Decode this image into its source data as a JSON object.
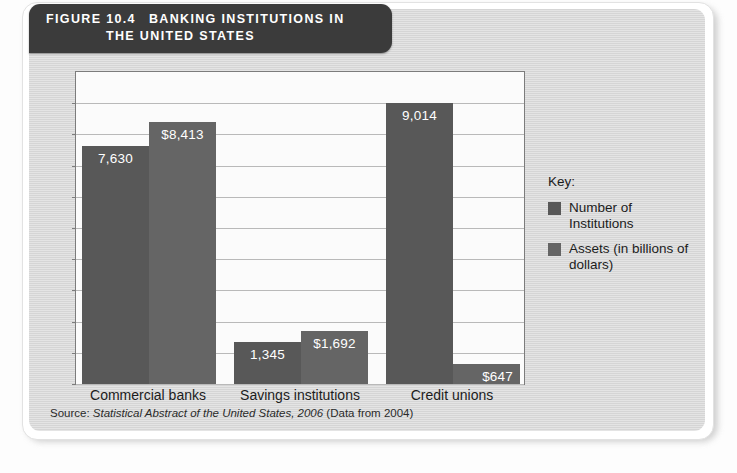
{
  "figure": {
    "number": "FIGURE 10.4",
    "title_line1": "BANKING INSTITUTIONS IN",
    "title_line2": "THE UNITED STATES",
    "source_prefix": "Source: ",
    "source_title": "Statistical Abstract of the United States, 2006",
    "source_suffix": " (Data from 2004)"
  },
  "legend": {
    "title": "Key:",
    "items": [
      {
        "label": "Number of Institutions",
        "color": "#585858"
      },
      {
        "label": "Assets (in billions of dollars)",
        "color": "#656565"
      }
    ]
  },
  "chart_data": {
    "type": "bar",
    "title": "Banking Institutions in the United States",
    "xlabel": "",
    "ylabel": "",
    "ylim": [
      0,
      10000
    ],
    "grid": true,
    "gridline_count": 10,
    "y_tick_labels_shown": false,
    "legend_position": "right",
    "categories": [
      "Commercial banks",
      "Savings institutions",
      "Credit unions"
    ],
    "series": [
      {
        "name": "Number of Institutions",
        "color": "#585858",
        "values": [
          7630,
          1345,
          9014
        ],
        "labels": [
          "7,630",
          "1,345",
          "9,014"
        ]
      },
      {
        "name": "Assets (in billions of dollars)",
        "color": "#656565",
        "values": [
          8413,
          1692,
          647
        ],
        "labels": [
          "$8,413",
          "$1,692",
          "$647"
        ]
      }
    ]
  }
}
